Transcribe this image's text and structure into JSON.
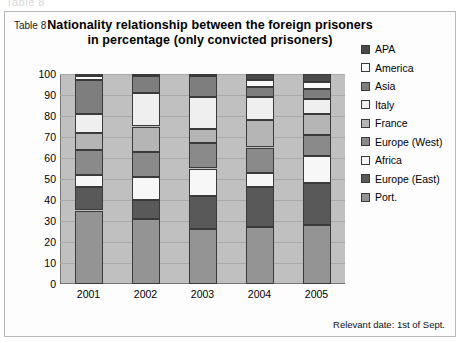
{
  "ghost_text": "Table 8",
  "table_label": "Table 8",
  "footnote": "Relevant date: 1st of Sept.",
  "chart_data": {
    "type": "bar",
    "stacked": true,
    "title": "Nationality relationship between the foreign prisoners in percentage (only convicted prisoners)",
    "xlabel": "",
    "ylabel": "",
    "ylim": [
      0,
      100
    ],
    "ytick_step": 10,
    "yticks": [
      100,
      90,
      80,
      70,
      60,
      50,
      40,
      30,
      20,
      10,
      0
    ],
    "grid": true,
    "legend_position": "right",
    "plot_background": "#c0c0c0",
    "categories": [
      "2001",
      "2002",
      "2003",
      "2004",
      "2005"
    ],
    "legend_order": [
      "APA",
      "America",
      "Asia",
      "Italy",
      "France",
      "Europe (West)",
      "Africa",
      "Europe (East)",
      "Port."
    ],
    "stack_order_bottom_to_top": [
      "Port.",
      "Europe (East)",
      "Africa",
      "Europe (West)",
      "France",
      "Italy",
      "Asia",
      "America",
      "APA"
    ],
    "series": [
      {
        "name": "Port.",
        "color": "#949494",
        "values": [
          35,
          31,
          26,
          27,
          28
        ]
      },
      {
        "name": "Europe (East)",
        "color": "#595959",
        "values": [
          11,
          9,
          16,
          19,
          20
        ]
      },
      {
        "name": "Africa",
        "color": "#f7f7f7",
        "values": [
          6,
          11,
          13,
          7,
          13
        ]
      },
      {
        "name": "Europe (West)",
        "color": "#8a8a8a",
        "values": [
          12,
          12,
          12,
          12,
          10
        ]
      },
      {
        "name": "France",
        "color": "#b5b5b5",
        "values": [
          8,
          12,
          7,
          13,
          10
        ]
      },
      {
        "name": "Italy",
        "color": "#efefef",
        "values": [
          9,
          16,
          15,
          11,
          7
        ]
      },
      {
        "name": "Asia",
        "color": "#7e7e7e",
        "values": [
          16,
          8,
          10,
          5,
          5
        ]
      },
      {
        "name": "America",
        "color": "#fafafa",
        "values": [
          2,
          0,
          0,
          3,
          3
        ]
      },
      {
        "name": "APA",
        "color": "#4a4a4a",
        "values": [
          1,
          1,
          1,
          3,
          4
        ]
      }
    ]
  }
}
